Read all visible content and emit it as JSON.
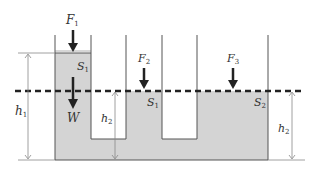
{
  "diagram": {
    "colors": {
      "liquid": "#d4d4d4",
      "wall": "#555555",
      "dashed_line": "#222222",
      "arrow": "#222222",
      "dimension": "#888888"
    },
    "labels": {
      "F1": {
        "main": "F",
        "sub": "1"
      },
      "F2": {
        "main": "F",
        "sub": "2"
      },
      "F3": {
        "main": "F",
        "sub": "3"
      },
      "S1_left": {
        "main": "S",
        "sub": "1"
      },
      "S1_mid": {
        "main": "S",
        "sub": "1"
      },
      "S2": {
        "main": "S",
        "sub": "2"
      },
      "W": {
        "main": "W",
        "sub": ""
      },
      "h1": {
        "main": "h",
        "sub": "1"
      },
      "h2_mid": {
        "main": "h",
        "sub": "2"
      },
      "h2_right": {
        "main": "h",
        "sub": "2"
      }
    }
  }
}
